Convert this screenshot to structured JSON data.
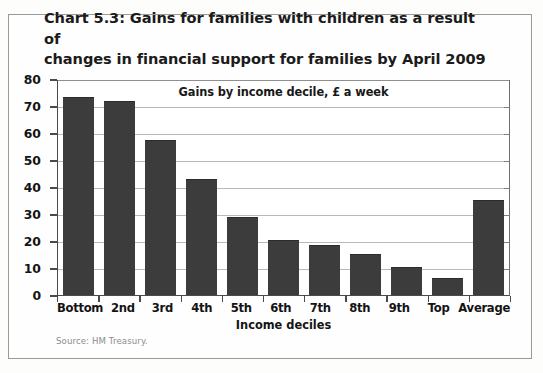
{
  "figure": {
    "title_line_1": "Chart 5.3: Gains for families with children as a result of",
    "title_line_2": "changes in financial support for families by April 2009",
    "source_note": "Source: HM Treasury."
  },
  "colors": {
    "bar": "#3c3c3c",
    "axis": "#4a4a4a",
    "gridline": "#b9b9b9",
    "frame": "#9a9a9a",
    "text": "#141414",
    "source_text": "#8d8d8d",
    "background": "#fefefe"
  },
  "chart_data": {
    "type": "bar",
    "title": "Chart 5.3: Gains for families with children as a result of changes in financial support for families by April 2009",
    "subtitle": "Gains by income decile, £ a week",
    "xlabel": "Income deciles",
    "ylabel": "",
    "ylim": [
      0,
      80
    ],
    "yticks": [
      0,
      10,
      20,
      30,
      40,
      50,
      60,
      70,
      80
    ],
    "ytick_labels": [
      "0",
      "10",
      "20",
      "30",
      "40",
      "50",
      "60",
      "70",
      "80"
    ],
    "grid": true,
    "legend": false,
    "units": "£ a week",
    "categories": [
      "Bottom",
      "2nd",
      "3rd",
      "4th",
      "5th",
      "6th",
      "7th",
      "8th",
      "9th",
      "Top",
      "Average"
    ],
    "values": [
      73,
      71.5,
      57,
      42.5,
      28.5,
      20,
      18,
      15,
      10,
      6,
      35
    ],
    "source": "Source: HM Treasury."
  }
}
